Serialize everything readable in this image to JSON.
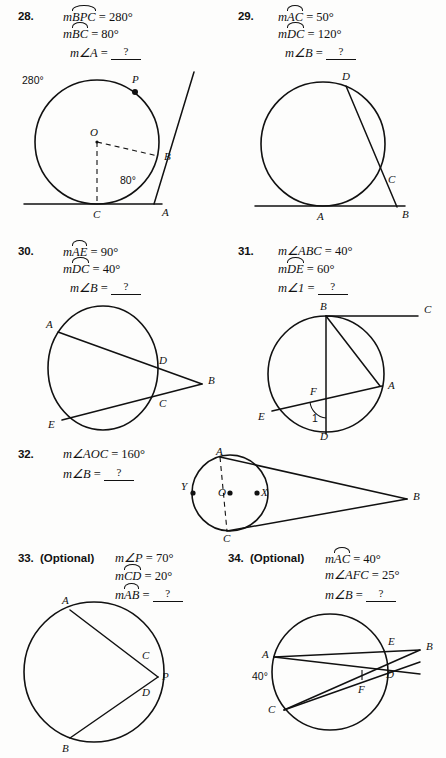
{
  "page": {
    "width": 446,
    "height": 758,
    "background": "#fdfdfc",
    "ink": "#111111"
  },
  "problems": [
    {
      "number": "28.",
      "optional_label": "",
      "lines": [
        {
          "prefix": "m",
          "arc": "BPC",
          "angle": "",
          "rel": " = ",
          "value": "280°"
        },
        {
          "prefix": "m",
          "arc": "BC",
          "angle": "",
          "rel": " = ",
          "value": "80°"
        },
        {
          "prefix": "m",
          "arc": "",
          "angle": "∠A",
          "rel": " = ",
          "value": "?"
        }
      ],
      "figure": {
        "name": "circle-tangent-secant-28",
        "labels": [
          "O",
          "P",
          "B",
          "C",
          "A"
        ],
        "annotations": [
          "280°",
          "80°"
        ]
      }
    },
    {
      "number": "29.",
      "optional_label": "",
      "lines": [
        {
          "prefix": "m",
          "arc": "AC",
          "angle": "",
          "rel": " = ",
          "value": "50°"
        },
        {
          "prefix": "m",
          "arc": "DC",
          "angle": "",
          "rel": " = ",
          "value": "120°"
        },
        {
          "prefix": "m",
          "arc": "",
          "angle": "∠B",
          "rel": " = ",
          "value": "?"
        }
      ],
      "figure": {
        "name": "circle-tangent-secant-29",
        "labels": [
          "D",
          "C",
          "A",
          "B"
        ],
        "annotations": []
      }
    },
    {
      "number": "30.",
      "optional_label": "",
      "lines": [
        {
          "prefix": "m",
          "arc": "AE",
          "angle": "",
          "rel": " = ",
          "value": "90°"
        },
        {
          "prefix": "m",
          "arc": "DC",
          "angle": "",
          "rel": " = ",
          "value": "40°"
        },
        {
          "prefix": "m",
          "arc": "",
          "angle": "∠B",
          "rel": " = ",
          "value": "?"
        }
      ],
      "figure": {
        "name": "circle-two-secants-30",
        "labels": [
          "A",
          "D",
          "B",
          "C",
          "E"
        ],
        "annotations": []
      }
    },
    {
      "number": "31.",
      "optional_label": "",
      "lines": [
        {
          "prefix": "m",
          "arc": "",
          "angle": "∠ABC",
          "rel": " = ",
          "value": "40°"
        },
        {
          "prefix": "m",
          "arc": "DE",
          "angle": "",
          "rel": " = ",
          "value": "60°"
        },
        {
          "prefix": "m",
          "arc": "",
          "angle": "∠1",
          "rel": " = ",
          "value": "?"
        }
      ],
      "figure": {
        "name": "circle-chords-tangent-31",
        "labels": [
          "B",
          "C",
          "A",
          "F",
          "E",
          "D"
        ],
        "annotations": [
          "1"
        ]
      }
    },
    {
      "number": "32.",
      "optional_label": "",
      "lines": [
        {
          "prefix": "m",
          "arc": "",
          "angle": "∠AOC",
          "rel": " = ",
          "value": "160°"
        },
        {
          "prefix": "m",
          "arc": "",
          "angle": "∠B",
          "rel": " = ",
          "value": "?"
        }
      ],
      "figure": {
        "name": "circle-two-tangents-32",
        "labels": [
          "A",
          "Y",
          "O",
          "X",
          "C",
          "B"
        ],
        "annotations": []
      }
    },
    {
      "number": "33.",
      "optional_label": "(Optional)",
      "lines": [
        {
          "prefix": "m",
          "arc": "",
          "angle": "∠P",
          "rel": " = ",
          "value": "70°"
        },
        {
          "prefix": "m",
          "arc": "CD",
          "angle": "",
          "rel": " = ",
          "value": "20°"
        },
        {
          "prefix": "m",
          "arc": "AB",
          "angle": "",
          "rel": " = ",
          "value": "?"
        }
      ],
      "figure": {
        "name": "circle-two-secants-33",
        "labels": [
          "A",
          "C",
          "P",
          "D",
          "B"
        ],
        "annotations": []
      }
    },
    {
      "number": "34.",
      "optional_label": "(Optional)",
      "lines": [
        {
          "prefix": "m",
          "arc": "AC",
          "angle": "",
          "rel": " = ",
          "value": "40°"
        },
        {
          "prefix": "m",
          "arc": "",
          "angle": "∠AFC",
          "rel": " = ",
          "value": "25°"
        },
        {
          "prefix": "m",
          "arc": "",
          "angle": "∠B",
          "rel": " = ",
          "value": "?"
        }
      ],
      "figure": {
        "name": "circle-secants-34",
        "labels": [
          "A",
          "E",
          "B",
          "D",
          "F",
          "C"
        ],
        "annotations": [
          "40°"
        ]
      }
    }
  ]
}
